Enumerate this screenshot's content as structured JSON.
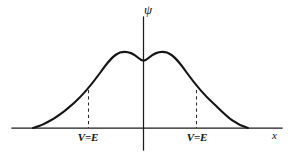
{
  "figure": {
    "background_color": "#ffffff",
    "ink_color": "#141414",
    "width": 293,
    "height": 160,
    "axes": {
      "vertical_axis_label": "ψ",
      "horizontal_axis_label": "x",
      "vertical_axis_x": 143,
      "vertical_axis_top": 17,
      "vertical_axis_bottom": 150,
      "horizontal_axis_y": 128,
      "horizontal_axis_left": 12,
      "horizontal_axis_right": 282
    },
    "markers": [
      {
        "name": "turning-point-left",
        "label": "V=E",
        "x": 88,
        "line_top": 90,
        "line_bottom": 128
      },
      {
        "name": "turning-point-right",
        "label": "V=E",
        "x": 196,
        "line_top": 90,
        "line_bottom": 128
      }
    ]
  },
  "chart_data": {
    "type": "line",
    "title": "",
    "subtitle": "",
    "xlabel": "x",
    "ylabel": "ψ",
    "grid": false,
    "legend": null,
    "xlim": [
      12,
      282
    ],
    "ylim": [
      128,
      52
    ],
    "annotations": [
      {
        "text": "V=E",
        "x": 88,
        "y": 137
      },
      {
        "text": "V=E",
        "x": 196,
        "y": 137
      },
      {
        "text": "ψ",
        "x": 146,
        "y": 10
      },
      {
        "text": "x",
        "x": 275,
        "y": 137
      }
    ],
    "series": [
      {
        "name": "psi",
        "x": [
          33,
          40,
          50,
          60,
          70,
          80,
          88,
          96,
          104,
          112,
          120,
          128,
          136,
          143,
          150,
          158,
          165,
          173,
          181,
          189,
          196,
          204,
          212,
          222,
          232,
          240,
          248
        ],
        "values": [
          128,
          124,
          117,
          110,
          103,
          96,
          90,
          81,
          71,
          60,
          53,
          52,
          55,
          60,
          55,
          52,
          52,
          54,
          60,
          70,
          80,
          90,
          100,
          110,
          119,
          124,
          128
        ],
        "path_definition": "M 33 128 C 48 124 62 114 74 103 C 84 94 92 84 100 73 C 107 63 113 55 120 52.5 C 127 50.5 134 54 138.5 58 C 141 60.3 142 60.6 143.5 60.6 C 145 60.6 146 60.3 148.5 58 C 153 54 160 50.5 167 52.5 C 174 55 180 63 187 73 C 195 84 203 94 213 103 C 225 114 233 124 248 128"
      }
    ]
  }
}
